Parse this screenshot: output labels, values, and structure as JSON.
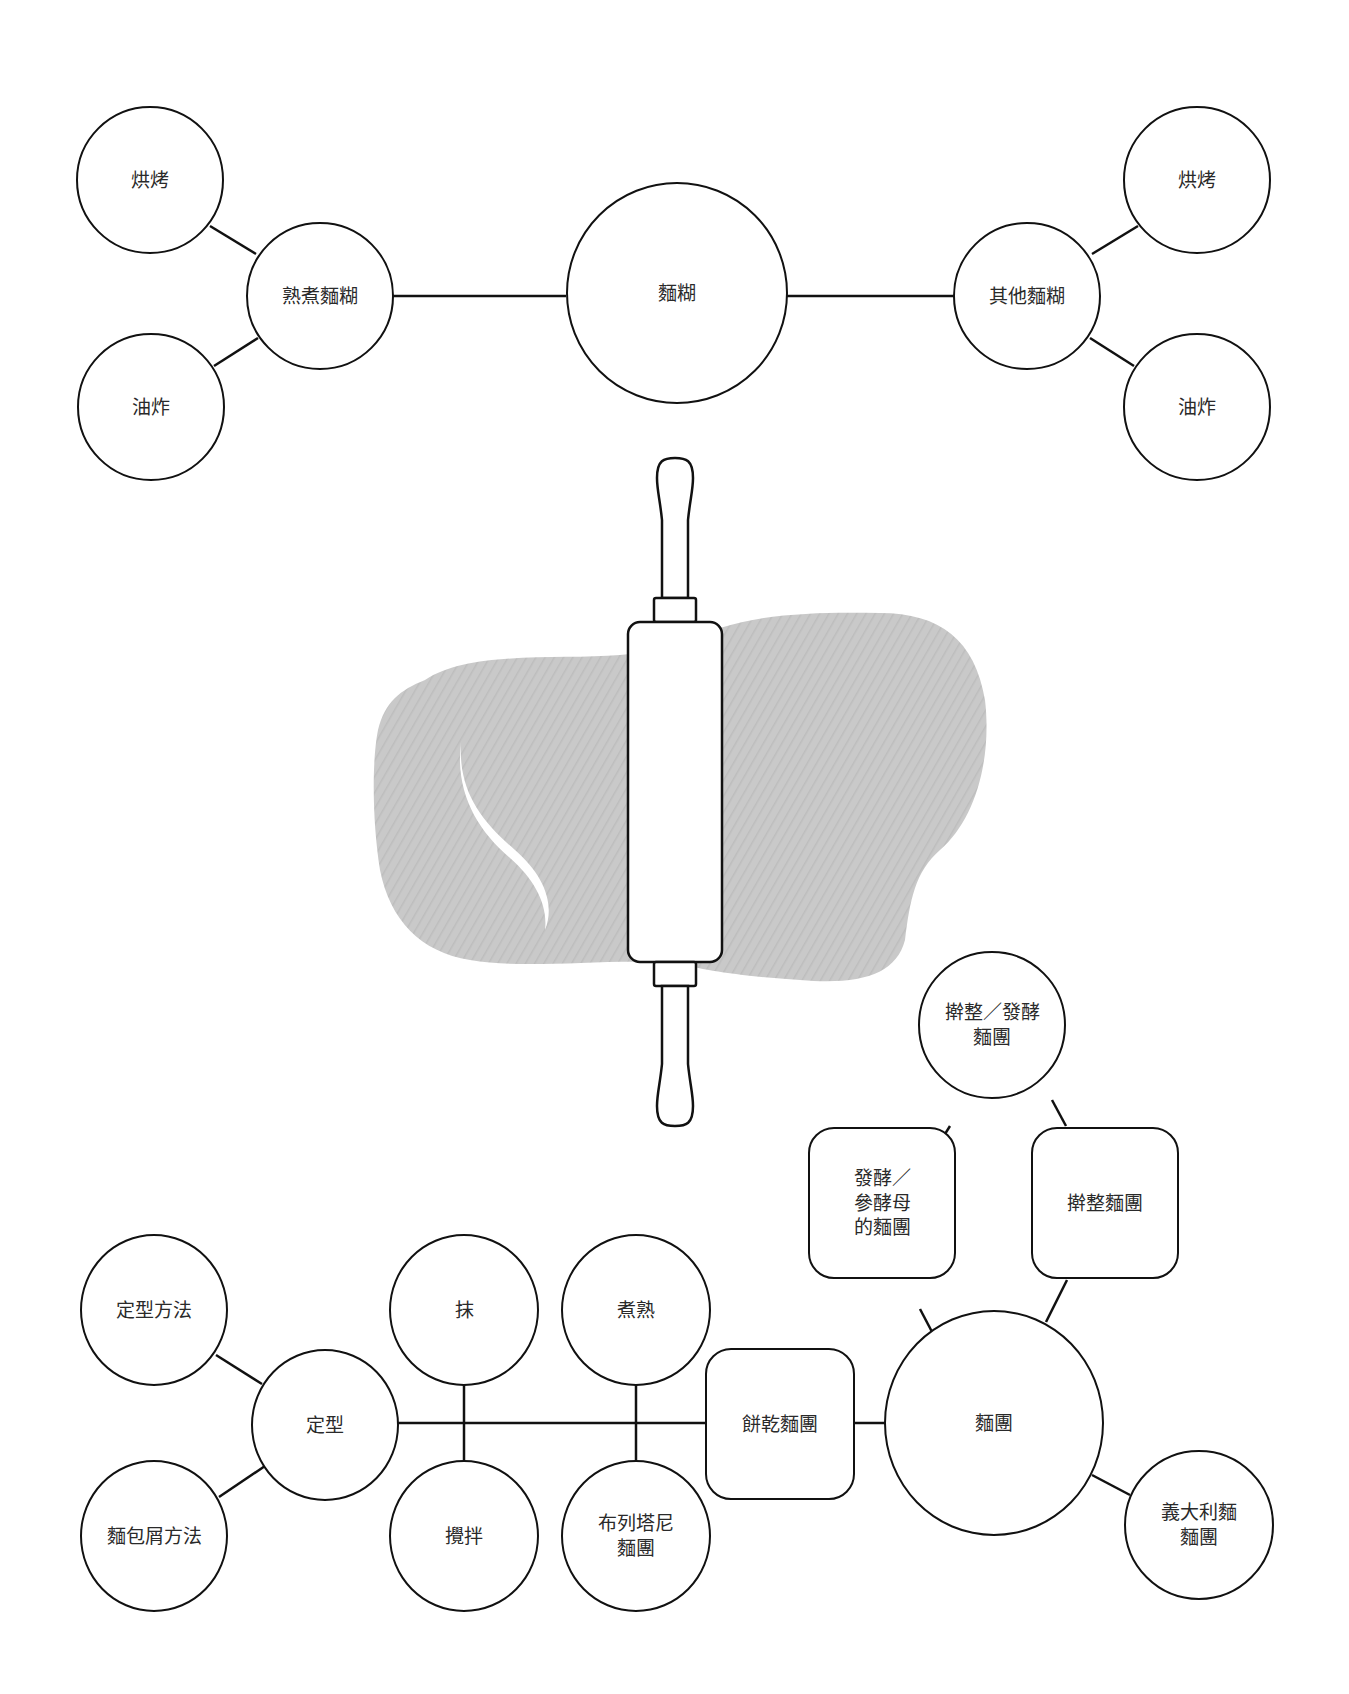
{
  "colors": {
    "stroke": "#111111",
    "text": "#2a2a2a",
    "dough": "#c8c8c8",
    "background": "#ffffff"
  },
  "top_diagram": {
    "center": {
      "label": "麵糊"
    },
    "left_branch": {
      "label": "熟煮麵糊",
      "children": [
        "烘烤",
        "油炸"
      ]
    },
    "right_branch": {
      "label": "其他麵糊",
      "children": [
        "烘烤",
        "油炸"
      ]
    }
  },
  "illustration": {
    "type": "rolling-pin-over-dough"
  },
  "bottom_diagram": {
    "center": {
      "label": "麵團"
    },
    "upper": {
      "top": {
        "label": "擀整／發酵\n麵團"
      },
      "left": {
        "label": "發酵／\n參酵母\n的麵團"
      },
      "right": {
        "label": "擀整麵團"
      }
    },
    "lower_right": {
      "label": "義大利麵\n麵團"
    },
    "cookie": {
      "label": "餅乾麵團"
    },
    "cook_pair": {
      "top": "煮熟",
      "bottom": "布列塔尼\n麵團"
    },
    "mix_pair": {
      "top": "抹",
      "bottom": "攪拌"
    },
    "shape": {
      "label": "定型",
      "children": [
        "定型方法",
        "麵包屑方法"
      ]
    }
  }
}
